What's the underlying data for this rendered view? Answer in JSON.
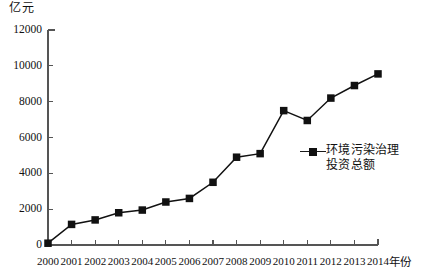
{
  "chart_data": {
    "type": "line",
    "title": "",
    "unit_label": "亿元",
    "xlabel": "年份",
    "ylabel": "",
    "categories": [
      "2000",
      "2001",
      "2002",
      "2003",
      "2004",
      "2005",
      "2006",
      "2007",
      "2008",
      "2009",
      "2010",
      "2011",
      "2012",
      "2013",
      "2014"
    ],
    "values": [
      100,
      1150,
      1400,
      1800,
      1950,
      2400,
      2600,
      3500,
      4900,
      5100,
      7500,
      6950,
      8200,
      8900,
      9550
    ],
    "series": [
      {
        "name": "环境污染治理投资总额",
        "values": [
          100,
          1150,
          1400,
          1800,
          1950,
          2400,
          2600,
          3500,
          4900,
          5100,
          7500,
          6950,
          8200,
          8900,
          9550
        ]
      }
    ],
    "ylim": [
      0,
      12000
    ],
    "yticks": [
      0,
      2000,
      4000,
      6000,
      8000,
      10000,
      12000
    ],
    "ytick_labels": [
      "0",
      "2000",
      "4000",
      "6000",
      "8000",
      "10000",
      "12000"
    ],
    "grid": false,
    "legend_position": "right",
    "marker": "square",
    "line_color": "#111111",
    "marker_color": "#111111",
    "axis_color": "#555555"
  },
  "legend": {
    "entries": [
      {
        "label": "环境污染治理投资总额"
      }
    ]
  }
}
